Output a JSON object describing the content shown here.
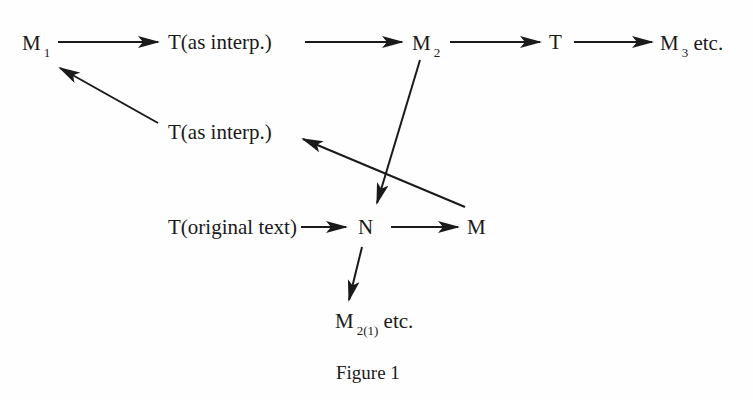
{
  "figure": {
    "caption": "Figure 1"
  },
  "nodes": {
    "m1": {
      "label": "M",
      "sub": "1"
    },
    "t_interp_top": {
      "label": "T(as interp.)"
    },
    "m2": {
      "label": "M",
      "sub": "2"
    },
    "t_top": {
      "label": "T"
    },
    "m3": {
      "label": "M",
      "sub": "3",
      "suffix": " etc."
    },
    "t_interp_mid": {
      "label": "T(as interp.)"
    },
    "t_original": {
      "label": "T(original text)"
    },
    "n": {
      "label": "N"
    },
    "m": {
      "label": "M"
    },
    "m21": {
      "label": "M",
      "sub": "2(1)",
      "suffix": " etc."
    }
  },
  "edges": [
    {
      "from": "M1",
      "to": "T(as interp.) top"
    },
    {
      "from": "T(as interp.) top",
      "to": "M2"
    },
    {
      "from": "M2",
      "to": "T"
    },
    {
      "from": "T",
      "to": "M3 etc."
    },
    {
      "from": "T(as interp.) middle",
      "to": "M1"
    },
    {
      "from": "M2",
      "to": "N"
    },
    {
      "from": "M",
      "to": "T(as interp.) middle"
    },
    {
      "from": "T(original text)",
      "to": "N"
    },
    {
      "from": "N",
      "to": "M"
    },
    {
      "from": "N",
      "to": "M2(1) etc."
    }
  ],
  "colors": {
    "ink": "#1a1a1a",
    "background": "#fefefe"
  }
}
